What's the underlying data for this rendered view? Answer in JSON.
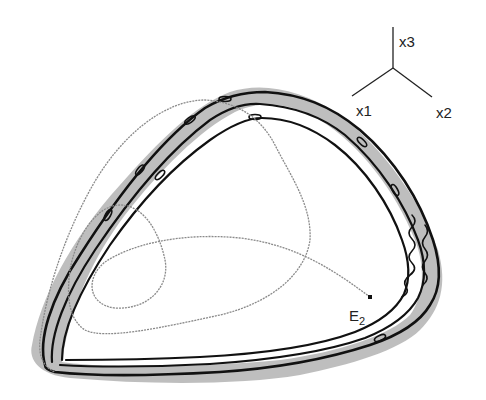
{
  "figure": {
    "type": "3d-phase-space-trajectory",
    "colors": {
      "background": "#ffffff",
      "attractor_line": "#111111",
      "attractor_band": "#9a9a9a",
      "transient_trajectory": "#8a8a8a",
      "axes": "#222222"
    }
  },
  "axes_triad": {
    "x3_label": "x3",
    "x1_label": "x1",
    "x2_label": "x2"
  },
  "equilibrium": {
    "label_main": "E",
    "label_sub": "2"
  }
}
